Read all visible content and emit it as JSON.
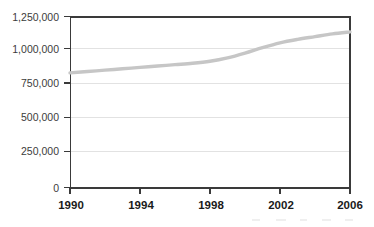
{
  "chart_data": {
    "type": "line",
    "title": "",
    "subtitle": "",
    "xlabel": "",
    "ylabel": "",
    "x": [
      1990,
      1991,
      1992,
      1993,
      1994,
      1995,
      1996,
      1997,
      1998,
      1999,
      2000,
      2001,
      2002,
      2003,
      2004,
      2005,
      2006
    ],
    "series": [
      {
        "name": "",
        "values": [
          840000,
          850000,
          860000,
          870000,
          880000,
          890000,
          900000,
          910000,
          925000,
          950000,
          985000,
          1025000,
          1060000,
          1085000,
          1105000,
          1125000,
          1140000
        ]
      }
    ],
    "xlim": [
      1990,
      2006
    ],
    "ylim": [
      0,
      1250000
    ],
    "xtick_labels": [
      "1990",
      "1994",
      "1998",
      "2002",
      "2006"
    ],
    "xtick_values": [
      1990,
      1994,
      1998,
      2002,
      2006
    ],
    "ytick_labels": [
      "0",
      "250,000",
      "500,000",
      "750,000",
      "1,000,000",
      "1,250,000"
    ],
    "ytick_values": [
      0,
      250000,
      500000,
      750000,
      1000000,
      1250000
    ],
    "grid": true,
    "grid_axis": "y",
    "legend": false,
    "legend_position": "none",
    "colors": {
      "line": "#c6c6c6",
      "grid": "#e2e2e2",
      "axis": "#3a3a3a",
      "ylabel_text": "#3b3b3b",
      "xlabel_text": "#1a1a1a",
      "background": "#ffffff"
    }
  }
}
